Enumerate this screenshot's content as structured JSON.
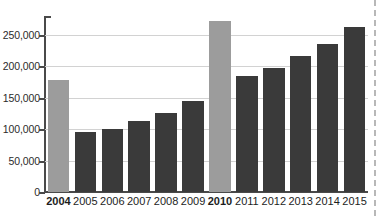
{
  "chart_data": {
    "type": "bar",
    "title": "",
    "subtitle": "",
    "xlabel": "",
    "ylabel": "",
    "categories": [
      "2004",
      "2005",
      "2006",
      "2007",
      "2008",
      "2009",
      "2010",
      "2011",
      "2012",
      "2013",
      "2014",
      "2015"
    ],
    "values": [
      178000,
      95000,
      100000,
      113000,
      126000,
      145000,
      272000,
      184000,
      198000,
      216000,
      235000,
      263000
    ],
    "series": [
      {
        "name": "Value",
        "values": [
          178000,
          95000,
          100000,
          113000,
          126000,
          145000,
          272000,
          184000,
          198000,
          216000,
          235000,
          263000
        ]
      }
    ],
    "highlighted_categories": [
      "2004",
      "2010"
    ],
    "bold_tick_labels": [
      "2004",
      "2010"
    ],
    "ylim": [
      0,
      280000
    ],
    "yticks": [
      0,
      50000,
      100000,
      150000,
      200000,
      250000
    ],
    "ytick_labels": [
      "0",
      "50,000",
      "100,000",
      "150,000",
      "200,000",
      "250,000"
    ],
    "grid": true,
    "legend": false,
    "legend_position": "none",
    "colors": {
      "bar_default": "#3a3a3a",
      "bar_highlight": "#9c9c9c",
      "gridline": "#d2d2d2",
      "axis": "#4a4a4a",
      "tick_text": "#2b2b2b",
      "category_text": "#1d1d1d",
      "background": "#ffffff",
      "edge_dashes": "#b8b8b8"
    }
  }
}
